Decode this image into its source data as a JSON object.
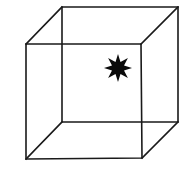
{
  "figure": {
    "stroke_color": "#1a1a1a",
    "star_color": "#0a0a0a",
    "background": "#ffffff"
  },
  "cube": {
    "front_face": {
      "tl": [
        26,
        44
      ],
      "tr": [
        141,
        44
      ],
      "br": [
        142,
        158
      ],
      "bl": [
        26,
        159
      ]
    },
    "back_face": {
      "tl": [
        62,
        7
      ],
      "tr": [
        178,
        7
      ],
      "br": [
        178,
        122
      ],
      "bl": [
        62,
        122
      ]
    }
  },
  "star": {
    "points": 8,
    "center": [
      118,
      68
    ],
    "outer_radius": 14,
    "inner_radius": 6.5
  }
}
